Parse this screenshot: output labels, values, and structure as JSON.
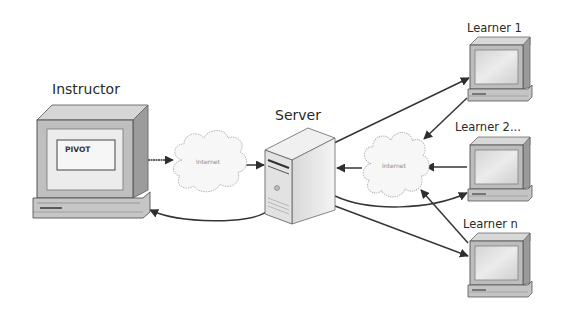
{
  "diagram": {
    "nodes": {
      "instructor": {
        "label": "Instructor",
        "screen_text": "PIVOT"
      },
      "server": {
        "label": "Server"
      },
      "cloud_left": {
        "label": "Internet"
      },
      "cloud_right": {
        "label": "Internet"
      },
      "learner1": {
        "label": "Learner 1"
      },
      "learner2": {
        "label": "Learner 2..."
      },
      "learnern": {
        "label": "Learner n"
      }
    },
    "edges": [
      {
        "from": "instructor",
        "to": "cloud_left"
      },
      {
        "from": "cloud_left",
        "to": "server"
      },
      {
        "from": "server",
        "to": "instructor"
      },
      {
        "from": "server",
        "to": "learner1"
      },
      {
        "from": "learner1",
        "to": "cloud_right"
      },
      {
        "from": "learner2",
        "to": "cloud_right"
      },
      {
        "from": "cloud_right",
        "to": "server"
      },
      {
        "from": "server",
        "to": "learner2"
      },
      {
        "from": "server",
        "to": "learnern"
      },
      {
        "from": "learnern",
        "to": "cloud_right"
      }
    ],
    "colors": {
      "line": "#3a3a3a",
      "monitor_body": "#c8c8c8",
      "monitor_side": "#9a9a9a",
      "screen": "#e2e2e2",
      "cloud_fill": "#f7f7f7",
      "cloud_stroke": "#b5b5b5"
    }
  }
}
